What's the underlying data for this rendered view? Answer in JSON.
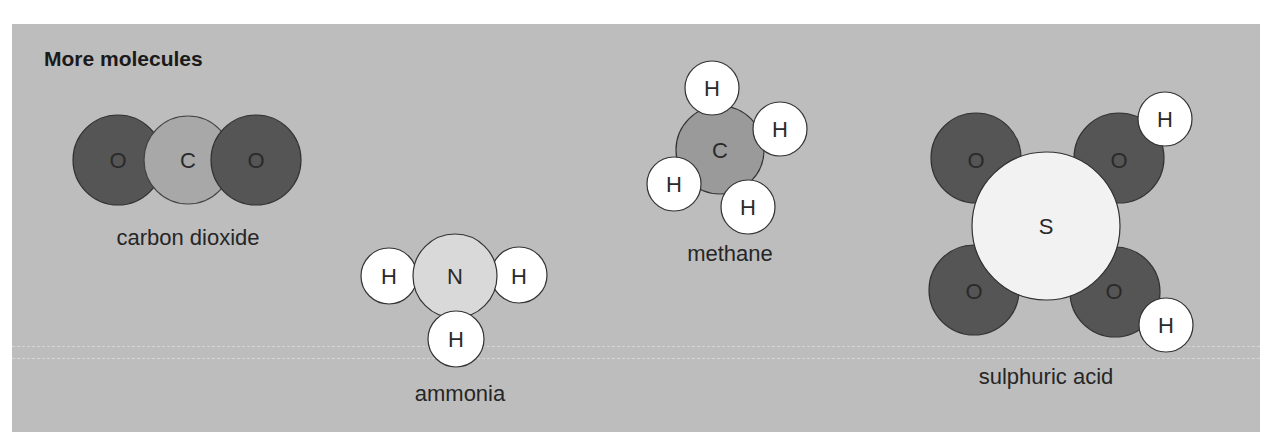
{
  "title": "More molecules",
  "colors": {
    "background": "#bdbdbd",
    "oxygen": "#555555",
    "carbon": "#9a9a9a",
    "carbon_co2": "#a8a8a8",
    "nitrogen": "#d9d9d9",
    "hydrogen": "#ffffff",
    "sulphur": "#f2f2f2",
    "outline": "#333333"
  },
  "molecules": [
    {
      "name": "carbon dioxide",
      "atoms": [
        {
          "symbol": "O"
        },
        {
          "symbol": "C"
        },
        {
          "symbol": "O"
        }
      ]
    },
    {
      "name": "ammonia",
      "atoms": [
        {
          "symbol": "N"
        },
        {
          "symbol": "H"
        },
        {
          "symbol": "H"
        },
        {
          "symbol": "H"
        }
      ]
    },
    {
      "name": "methane",
      "atoms": [
        {
          "symbol": "C"
        },
        {
          "symbol": "H"
        },
        {
          "symbol": "H"
        },
        {
          "symbol": "H"
        },
        {
          "symbol": "H"
        }
      ]
    },
    {
      "name": "sulphuric acid",
      "atoms": [
        {
          "symbol": "S"
        },
        {
          "symbol": "O"
        },
        {
          "symbol": "O"
        },
        {
          "symbol": "O"
        },
        {
          "symbol": "O"
        },
        {
          "symbol": "H"
        },
        {
          "symbol": "H"
        }
      ]
    }
  ]
}
